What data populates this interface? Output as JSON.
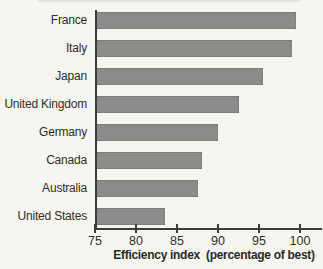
{
  "chart_data": {
    "type": "bar",
    "orientation": "horizontal",
    "categories": [
      "France",
      "Italy",
      "Japan",
      "United Kingdom",
      "Germany",
      "Canada",
      "Australia",
      "United States"
    ],
    "values": [
      99.5,
      99,
      95.5,
      92.5,
      90,
      88,
      87.5,
      83.5
    ],
    "title": "",
    "xlabel": "Efficiency index  (percentage of best)",
    "ylabel": "",
    "xlim": [
      75,
      100
    ],
    "x_ticks": [
      75,
      80,
      85,
      90,
      95,
      100
    ],
    "grid": false,
    "legend": false,
    "bar_color": "#8c8c8c",
    "axis_color": "#3d3c3a",
    "text_color": "#2e2d2b",
    "background_color": "#f6f5f0"
  }
}
